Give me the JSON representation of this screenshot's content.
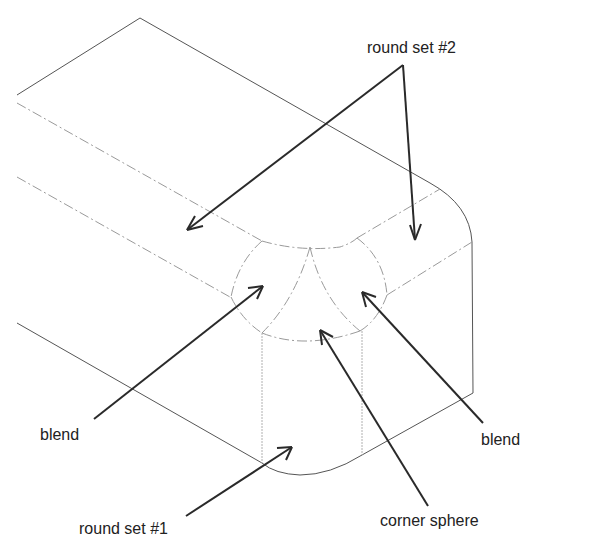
{
  "diagram": {
    "type": "cad-fillet-corner-illustration",
    "labels": {
      "round_set_2": "round set #2",
      "round_set_1": "round set #1",
      "blend_left": "blend",
      "blend_right": "blend",
      "corner_sphere": "corner sphere"
    },
    "colors": {
      "background": "#ffffff",
      "model_edge": "#555555",
      "tangent_edge": "#9a9a9a",
      "leader_arrow": "#2a2a2a",
      "text": "#222222"
    }
  }
}
